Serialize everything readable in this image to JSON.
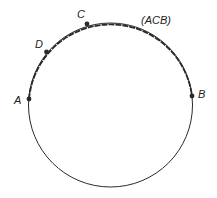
{
  "diagram": {
    "type": "circle-with-arc",
    "circle": {
      "cx": 110.5,
      "cy": 105,
      "r": 82
    },
    "colors": {
      "stroke": "#2a2a2a",
      "point": "#2a2a2a",
      "background": "#ffffff"
    },
    "points": [
      {
        "id": "A",
        "label": "A",
        "x": 29,
        "y": 99,
        "lx": 17,
        "ly": 104
      },
      {
        "id": "D",
        "label": "D",
        "x": 46.5,
        "y": 52,
        "lx": 35,
        "ly": 48
      },
      {
        "id": "C",
        "label": "C",
        "x": 87,
        "y": 24,
        "lx": 79,
        "ly": 18
      },
      {
        "id": "B",
        "label": "B",
        "x": 192,
        "y": 96,
        "lx": 199,
        "ly": 98
      }
    ],
    "arc_label": {
      "text": "(ACB)",
      "x": 141,
      "y": 24
    },
    "highlighted_arc": "ACB"
  }
}
